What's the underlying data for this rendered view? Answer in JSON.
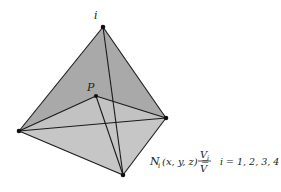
{
  "diagram": {
    "colors": {
      "face_dark": "#a9a9a9",
      "face_light": "#c6c6c6",
      "edge": "#1a1a1a",
      "vertex": "#111111"
    },
    "vertices": {
      "top": {
        "label": "i",
        "x": 103,
        "y": 27
      },
      "interior": {
        "label": "P",
        "x": 96,
        "y": 96
      },
      "left": {
        "label": "",
        "x": 19,
        "y": 131
      },
      "right": {
        "label": "",
        "x": 166,
        "y": 118
      },
      "bottom": {
        "label": "",
        "x": 123,
        "y": 175
      }
    },
    "formula": {
      "lhs": "N",
      "lhs_sub": "i",
      "args": "(x, y, z) =",
      "numerator": "V",
      "numerator_sub": "i",
      "denominator": "V",
      "condition": "i = 1, 2, 3, 4"
    }
  }
}
